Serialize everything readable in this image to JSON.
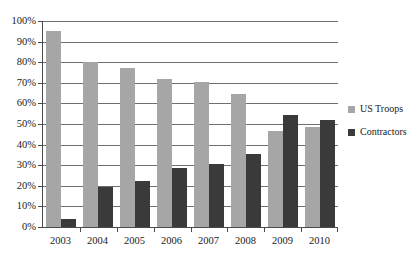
{
  "chart_data": {
    "type": "bar",
    "title": "",
    "subtitle": "",
    "xlabel": "",
    "ylabel": "",
    "categories": [
      "2003",
      "2004",
      "2005",
      "2006",
      "2007",
      "2008",
      "2009",
      "2010"
    ],
    "series": [
      {
        "name": "US Troops",
        "color": "#a6a6a6",
        "values": [
          95,
          80,
          77,
          72,
          70.5,
          64.5,
          46.5,
          48.5
        ]
      },
      {
        "name": "Contractors",
        "color": "#3a3a3a",
        "values": [
          4,
          19.5,
          22.5,
          28.5,
          30.5,
          35.5,
          54.5,
          52
        ]
      }
    ],
    "ylim": [
      0,
      100
    ],
    "ytick_values": [
      0,
      10,
      20,
      30,
      40,
      50,
      60,
      70,
      80,
      90,
      100
    ],
    "ytick_labels": [
      "0%",
      "10%",
      "20%",
      "30%",
      "40%",
      "50%",
      "60%",
      "70%",
      "80%",
      "90%",
      "100%"
    ],
    "grid": true,
    "legend_position": "right"
  },
  "legend": {
    "items": [
      {
        "label": "US Troops",
        "swatch": "troops"
      },
      {
        "label": "Contractors",
        "swatch": "contract"
      }
    ]
  }
}
